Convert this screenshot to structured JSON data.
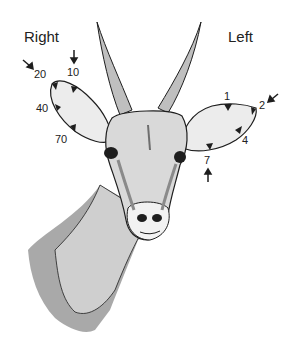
{
  "figure": {
    "colors": {
      "ink": "#1e1e1e",
      "fur": "#d9d9d9",
      "fur_light": "#ececec",
      "horn": "#bfbfbf",
      "neck_shadow": "#a9a9a9",
      "background": "#ffffff"
    }
  },
  "ears": {
    "right": {
      "label": "Right",
      "codes": [
        "10",
        "20",
        "40",
        "70"
      ]
    },
    "left": {
      "label": "Left",
      "codes": [
        "1",
        "2",
        "4",
        "7"
      ]
    }
  }
}
